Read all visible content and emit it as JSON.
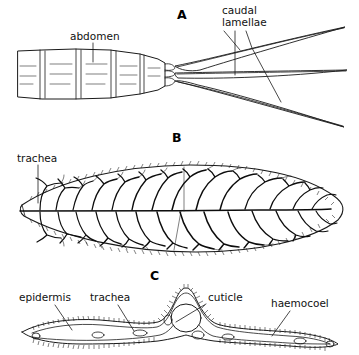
{
  "figure": {
    "background_color": "#ffffff",
    "ink_color": "#1a1a1a",
    "panels": [
      {
        "letter": "A",
        "letter_x": 177,
        "letter_y": 19,
        "caption": "abdomen and three caudal lamellae of a damselfly larva, dorsal view"
      },
      {
        "letter": "B",
        "letter_x": 172,
        "letter_y": 142,
        "caption": "single caudal lamella showing branching tracheae"
      },
      {
        "letter": "C",
        "letter_x": 150,
        "letter_y": 280,
        "caption": "transverse section through a caudal lamella"
      }
    ],
    "labels": [
      {
        "id": "abdomen",
        "text": "abdomen",
        "x": 70,
        "y": 40,
        "anchor": "start",
        "panel": "A"
      },
      {
        "id": "caudal-lamellae-line1",
        "text": "caudal",
        "x": 222,
        "y": 14,
        "anchor": "start",
        "panel": "A"
      },
      {
        "id": "caudal-lamellae-line2",
        "text": "lamellae",
        "x": 222,
        "y": 26,
        "anchor": "start",
        "panel": "A"
      },
      {
        "id": "trachea-b",
        "text": "trachea",
        "x": 17,
        "y": 162,
        "anchor": "start",
        "panel": "B"
      },
      {
        "id": "epidermis",
        "text": "epidermis",
        "x": 19,
        "y": 301,
        "anchor": "start",
        "panel": "C"
      },
      {
        "id": "trachea-c",
        "text": "trachea",
        "x": 90,
        "y": 301,
        "anchor": "start",
        "panel": "C"
      },
      {
        "id": "cuticle",
        "text": "cuticle",
        "x": 208,
        "y": 301,
        "anchor": "start",
        "panel": "C"
      },
      {
        "id": "haemocoel",
        "text": "haemocoel",
        "x": 271,
        "y": 307,
        "anchor": "start",
        "panel": "C"
      }
    ]
  }
}
